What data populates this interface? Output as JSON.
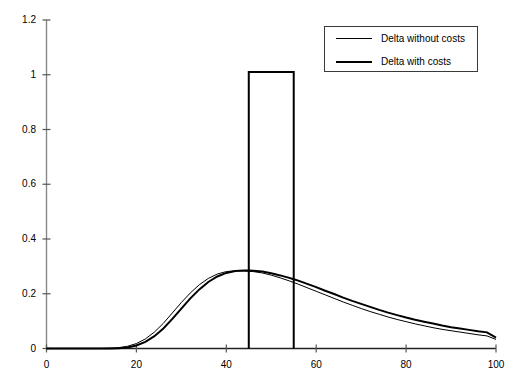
{
  "chart_data": {
    "type": "line",
    "title": "",
    "xlabel": "",
    "ylabel": "",
    "xlim": [
      0,
      100
    ],
    "ylim": [
      0,
      1.2
    ],
    "grid": false,
    "legend_position": "top-right",
    "xticks": [
      "0",
      "20",
      "40",
      "60",
      "80",
      "100"
    ],
    "xtick_values": [
      0,
      20,
      40,
      60,
      80,
      100
    ],
    "yticks": [
      "0",
      "0.2",
      "0.4",
      "0.6",
      "0.8",
      "1",
      "1.2"
    ],
    "ytick_values": [
      0,
      0.2,
      0.4,
      0.6,
      0.8,
      1,
      1.2
    ],
    "x": [
      0,
      2,
      4,
      6,
      8,
      10,
      12,
      14,
      16,
      18,
      20,
      22,
      24,
      26,
      28,
      30,
      32,
      34,
      36,
      38,
      40,
      42,
      44,
      45,
      46,
      48,
      50,
      52,
      54,
      55,
      56,
      58,
      60,
      62,
      64,
      66,
      68,
      70,
      72,
      74,
      76,
      78,
      80,
      82,
      84,
      86,
      88,
      90,
      92,
      94,
      96,
      98,
      100
    ],
    "series": [
      {
        "name": "Delta without costs",
        "style": "thin",
        "color": "#000000",
        "linewidth": 1,
        "values": [
          0.0,
          0.0,
          0.0,
          0.0,
          0.0,
          0.0,
          0.0,
          0.001,
          0.003,
          0.008,
          0.018,
          0.035,
          0.06,
          0.092,
          0.13,
          0.168,
          0.203,
          0.233,
          0.256,
          0.272,
          0.281,
          0.284,
          0.283,
          0.282,
          0.281,
          0.276,
          0.268,
          0.258,
          0.247,
          0.241,
          0.235,
          0.222,
          0.209,
          0.196,
          0.183,
          0.17,
          0.158,
          0.146,
          0.135,
          0.125,
          0.115,
          0.106,
          0.098,
          0.09,
          0.083,
          0.076,
          0.07,
          0.065,
          0.06,
          0.055,
          0.05,
          0.046,
          0.033
        ]
      },
      {
        "name": "Delta with costs",
        "style": "thick",
        "color": "#000000",
        "linewidth": 2,
        "values": [
          0.0,
          0.0,
          0.0,
          0.0,
          0.0,
          0.0,
          0.0,
          0.0,
          0.001,
          0.004,
          0.011,
          0.024,
          0.045,
          0.073,
          0.108,
          0.146,
          0.183,
          0.216,
          0.243,
          0.263,
          0.276,
          0.283,
          0.285,
          0.285,
          0.284,
          0.281,
          0.275,
          0.267,
          0.258,
          0.253,
          0.248,
          0.236,
          0.224,
          0.211,
          0.199,
          0.186,
          0.174,
          0.163,
          0.152,
          0.141,
          0.131,
          0.122,
          0.113,
          0.105,
          0.098,
          0.091,
          0.084,
          0.078,
          0.073,
          0.068,
          0.063,
          0.059,
          0.04
        ]
      },
      {
        "name": "step",
        "style": "thick",
        "color": "#000000",
        "linewidth": 2,
        "type": "step-rectangle",
        "step_x_start": 45,
        "step_x_end": 55,
        "step_height": 1.01,
        "baseline": 0
      }
    ]
  },
  "legend": {
    "items": [
      {
        "label": "Delta without costs",
        "style": "thin"
      },
      {
        "label": "Delta with costs",
        "style": "thick"
      }
    ]
  }
}
